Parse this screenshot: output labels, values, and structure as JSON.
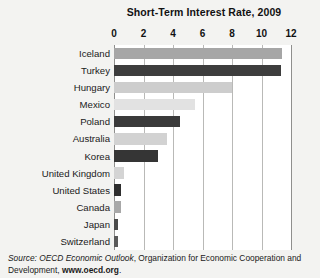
{
  "chart_data": {
    "type": "bar",
    "orientation": "horizontal",
    "title": "Short-Term Interest Rate, 2009",
    "xlabel": "",
    "ylabel": "",
    "xlim": [
      0,
      12
    ],
    "xticks": [
      0,
      2,
      4,
      6,
      8,
      10,
      12
    ],
    "grid": true,
    "legend": "none",
    "categories": [
      "Iceland",
      "Turkey",
      "Hungary",
      "Mexico",
      "Poland",
      "Australia",
      "Korea",
      "United Kingdom",
      "United States",
      "Canada",
      "Japan",
      "Switzerland"
    ],
    "values": [
      11.4,
      11.3,
      8.0,
      5.5,
      4.5,
      3.6,
      3.0,
      0.7,
      0.5,
      0.45,
      0.3,
      0.25
    ],
    "bar_colors": [
      "#a6a6a6",
      "#3d3d3d",
      "#cdcdcd",
      "#e2e2e2",
      "#3a3a3a",
      "#d2d2d2",
      "#353535",
      "#d4d4d4",
      "#2e2e2e",
      "#a8a8a8",
      "#4a4a4a",
      "#5a5a5a"
    ]
  },
  "source": {
    "prefix": "Source: OECD Economic Outlook",
    "middle": ", Organization for Economic Cooperation and Development, ",
    "url": "www.oecd.org",
    "suffix": "."
  }
}
